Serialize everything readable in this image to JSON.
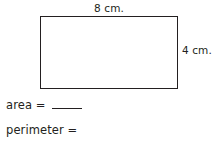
{
  "figure": {
    "shape_name": "rectangle",
    "top_label": "8 cm.",
    "right_label": "4 cm.",
    "stroke_color": "#231f20",
    "fill_color": "#ffffff"
  },
  "questions": [
    {
      "label": "area =",
      "answer": ""
    },
    {
      "label": "perimeter =",
      "answer": ""
    }
  ],
  "page": {
    "background_color": "#ffffff",
    "text_color": "#231f20"
  }
}
